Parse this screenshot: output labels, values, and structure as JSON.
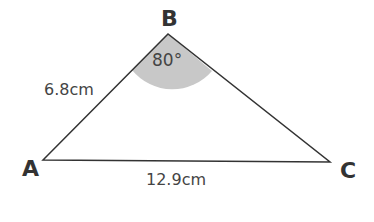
{
  "diagram": {
    "type": "triangle",
    "vertices": [
      {
        "label": "A"
      },
      {
        "label": "B"
      },
      {
        "label": "C"
      }
    ],
    "sides": {
      "AB": "6.8cm",
      "AC": "12.9cm"
    },
    "angle_B": "80°",
    "colors": {
      "line": "#333333",
      "angle_fill": "#c8c8c8"
    }
  }
}
